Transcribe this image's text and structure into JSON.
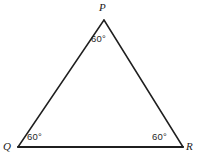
{
  "figure": {
    "type": "geometry-diagram",
    "shape": "triangle",
    "background_color": "#ffffff",
    "stroke_color": "#1f1f1f",
    "width": 201,
    "height": 157,
    "vertices": [
      {
        "id": "P",
        "label": "P",
        "x": 104,
        "y": 20,
        "angle_label": "60°"
      },
      {
        "id": "Q",
        "label": "Q",
        "x": 18,
        "y": 147,
        "angle_label": "60°"
      },
      {
        "id": "R",
        "label": "R",
        "x": 183,
        "y": 147,
        "angle_label": "60°"
      }
    ],
    "edges": [
      {
        "id": "PQ",
        "from": "P",
        "to": "Q",
        "stroke_width": 1.5
      },
      {
        "id": "PR",
        "from": "P",
        "to": "R",
        "stroke_width": 1.5
      },
      {
        "id": "QR",
        "from": "Q",
        "to": "R",
        "stroke_width": 2.1
      }
    ]
  },
  "chart_data": {
    "type": "diagram",
    "title": "",
    "categories": [
      "P",
      "Q",
      "R"
    ],
    "values": [
      60,
      60,
      60
    ],
    "unit": "degrees",
    "annotations": [
      "60°",
      "60°",
      "60°"
    ]
  }
}
